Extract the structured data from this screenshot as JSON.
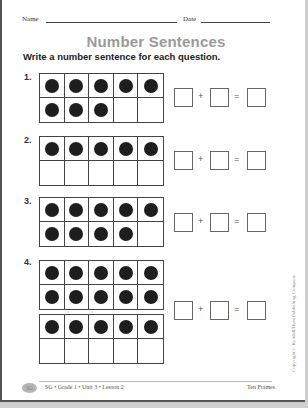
{
  "header": {
    "name_label": "Name",
    "date_label": "Date"
  },
  "title": "Number Sentences",
  "instruction": "Write a number sentence for each question.",
  "questions": [
    {
      "number": "1.",
      "frames": [
        {
          "filled": 8
        }
      ],
      "equation": {
        "plus": "+",
        "equals": "="
      }
    },
    {
      "number": "2.",
      "frames": [
        {
          "filled": 5
        }
      ],
      "equation": {
        "plus": "+",
        "equals": "="
      }
    },
    {
      "number": "3.",
      "frames": [
        {
          "filled": 9
        }
      ],
      "equation": {
        "plus": "+",
        "equals": "="
      }
    },
    {
      "number": "4.",
      "frames": [
        {
          "filled": 10
        },
        {
          "filled": 5
        }
      ],
      "equation": {
        "plus": "+",
        "equals": "="
      }
    }
  ],
  "copyright": "Copyright © Kendall/Hunt Publishing Company",
  "footer": {
    "page_badge": "SG",
    "left": "SG • Grade 1 • Unit 3 • Lesson 2",
    "right": "Ten Frames"
  }
}
